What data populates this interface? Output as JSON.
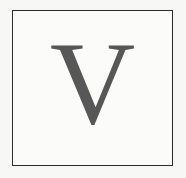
{
  "tile": {
    "letter": "V",
    "letter_color": "#575757",
    "border_color": "#2a2a2a",
    "background": "#f7f7f5"
  }
}
